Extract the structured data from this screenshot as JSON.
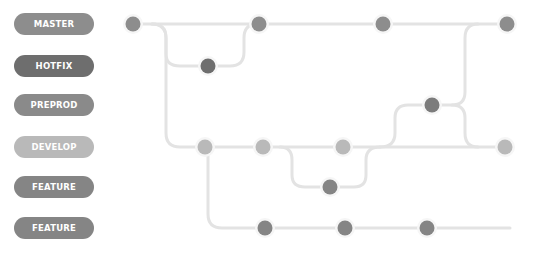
{
  "branches": [
    {
      "label": "MASTER",
      "color": "#8d8d8d",
      "y": 24
    },
    {
      "label": "HOTFIX",
      "color": "#6e6e6e",
      "y": 66
    },
    {
      "label": "PREPROD",
      "color": "#8a8a8a",
      "y": 105
    },
    {
      "label": "DEVELOP",
      "color": "#b9b9b9",
      "y": 147
    },
    {
      "label": "FEATURE",
      "color": "#858585",
      "y": 187
    },
    {
      "label": "FEATURE",
      "color": "#858585",
      "y": 228
    }
  ],
  "colors": {
    "line": "#e3e3e3",
    "halo": "#f6f6f6"
  }
}
